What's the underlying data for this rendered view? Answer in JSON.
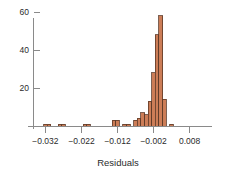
{
  "chart_data": {
    "type": "bar",
    "title": "",
    "subtitle": "",
    "xlabel": "Residuals",
    "ylabel": "",
    "grid": false,
    "legend": null,
    "xlim": [
      -0.0335,
      0.0095
    ],
    "ylim": [
      0,
      66
    ],
    "bin_width": 0.001,
    "x_ticks": [
      -0.032,
      -0.022,
      -0.012,
      -0.002,
      0.008
    ],
    "x_tick_labels": [
      "−0.032",
      "−0.022",
      "−0.012",
      "−0.002",
      "0.008"
    ],
    "y_ticks": [
      20,
      40,
      60
    ],
    "y_tick_labels": [
      "20",
      "40",
      "60"
    ],
    "colors": {
      "bar_fill": "#cc7d57",
      "bar_edge": "#5c3a28",
      "axis": "#8a8a8a",
      "text": "#2b2b2b",
      "background": "#ffffff"
    },
    "bins": [
      {
        "x0": -0.0325,
        "x1": -0.0315,
        "count": 1
      },
      {
        "x0": -0.0315,
        "x1": -0.0305,
        "count": 1
      },
      {
        "x0": -0.0285,
        "x1": -0.0275,
        "count": 1
      },
      {
        "x0": -0.0275,
        "x1": -0.0265,
        "count": 1
      },
      {
        "x0": -0.0215,
        "x1": -0.0205,
        "count": 1
      },
      {
        "x0": -0.0205,
        "x1": -0.0195,
        "count": 1
      },
      {
        "x0": -0.0135,
        "x1": -0.0125,
        "count": 3
      },
      {
        "x0": -0.0125,
        "x1": -0.0115,
        "count": 3
      },
      {
        "x0": -0.0105,
        "x1": -0.0095,
        "count": 1
      },
      {
        "x0": -0.0095,
        "x1": -0.0085,
        "count": 1
      },
      {
        "x0": -0.0075,
        "x1": -0.0065,
        "count": 3
      },
      {
        "x0": -0.0065,
        "x1": -0.0055,
        "count": 4
      },
      {
        "x0": -0.0055,
        "x1": -0.0045,
        "count": 7
      },
      {
        "x0": -0.0045,
        "x1": -0.0035,
        "count": 6
      },
      {
        "x0": -0.0035,
        "x1": -0.0025,
        "count": 13
      },
      {
        "x0": -0.0025,
        "x1": -0.0015,
        "count": 28
      },
      {
        "x0": -0.0015,
        "x1": -0.0005,
        "count": 48
      },
      {
        "x0": -0.0005,
        "x1": 0.0005,
        "count": 58
      },
      {
        "x0": 0.0005,
        "x1": 0.0015,
        "count": 14
      },
      {
        "x0": 0.0025,
        "x1": 0.0035,
        "count": 1
      }
    ],
    "categories": [
      "-0.0325",
      "-0.0315",
      "-0.0285",
      "-0.0275",
      "-0.0215",
      "-0.0205",
      "-0.0135",
      "-0.0125",
      "-0.0105",
      "-0.0095",
      "-0.0075",
      "-0.0065",
      "-0.0055",
      "-0.0045",
      "-0.0035",
      "-0.0025",
      "-0.0015",
      "-0.0005",
      "0.0005",
      "0.0025"
    ],
    "values": [
      1,
      1,
      1,
      1,
      1,
      1,
      3,
      3,
      1,
      1,
      3,
      4,
      7,
      6,
      13,
      28,
      48,
      58,
      14,
      1
    ]
  },
  "plot_geometry": {
    "left": 40,
    "right": 195,
    "baseline_y": 126,
    "top_y": 18,
    "px_per_x_unit": 3600,
    "px_per_count": 1.9
  }
}
